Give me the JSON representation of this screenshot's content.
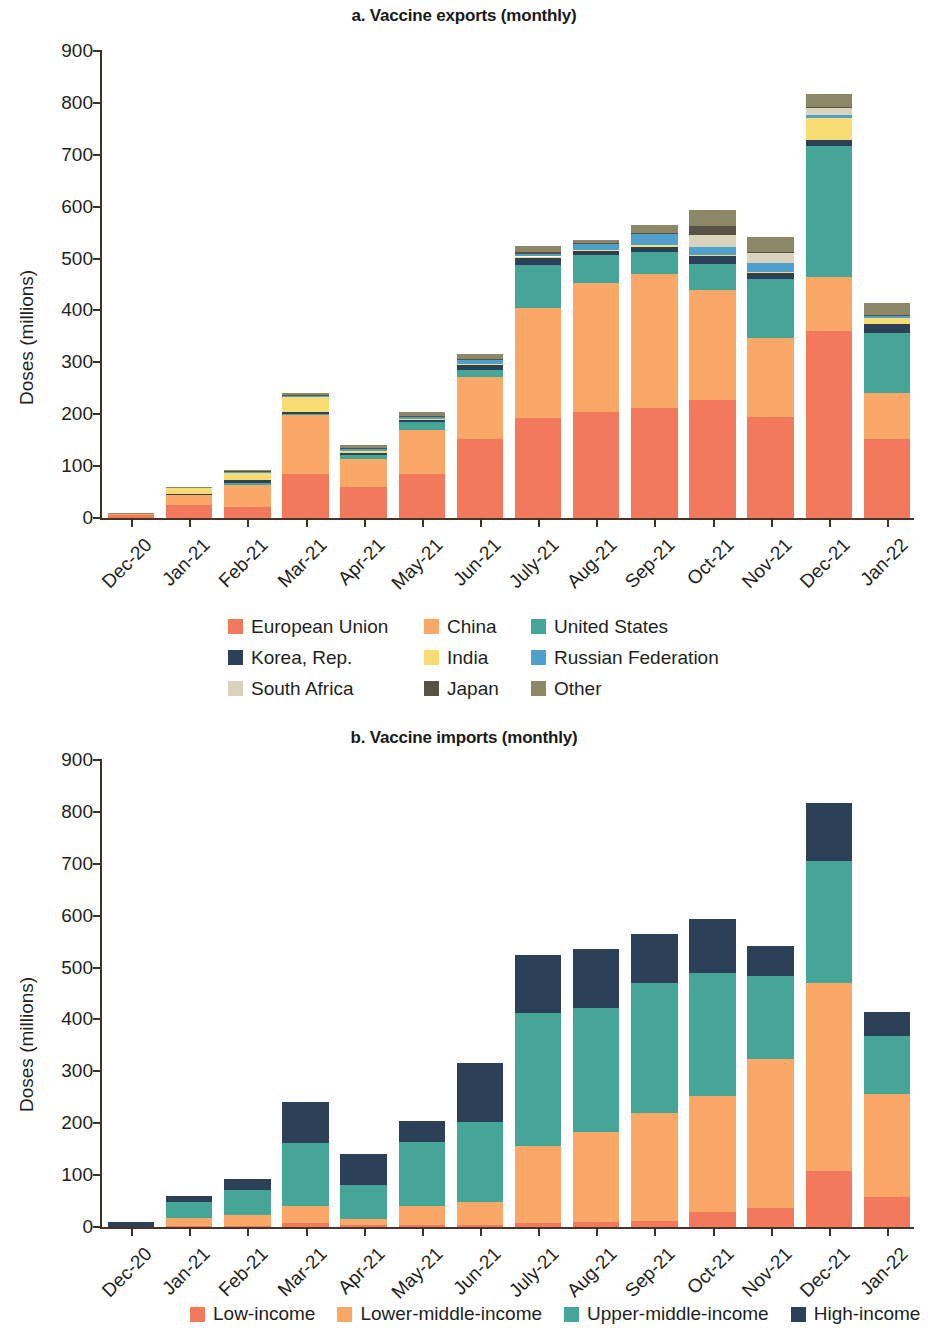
{
  "figure": {
    "panel_a_title": "a. Vaccine exports (monthly)",
    "panel_b_title": "b. Vaccine imports (monthly)",
    "y_axis_title": "Doses (millions)"
  },
  "colors": {
    "european_union": "#F2795B",
    "china": "#F9A868",
    "united_states": "#45A596",
    "korea_rep": "#2C4158",
    "india": "#F7DC74",
    "russian_federation": "#4FA0CC",
    "south_africa": "#D9D3BE",
    "japan": "#575242",
    "other": "#8C8767",
    "low_income": "#F2795B",
    "lower_middle_income": "#F9A868",
    "upper_middle_income": "#45A596",
    "high_income": "#2C4158",
    "axis": "#3A3226"
  },
  "chart_data": [
    {
      "type": "bar",
      "id": "vaccine-exports",
      "title": "a. Vaccine exports (monthly)",
      "stacked": true,
      "xlabel": "",
      "ylabel": "Doses (millions)",
      "ylim": [
        0,
        900
      ],
      "yticks": [
        0,
        100,
        200,
        300,
        400,
        500,
        600,
        700,
        800,
        900
      ],
      "grid": false,
      "legend_position": "bottom",
      "categories": [
        "Dec-20",
        "Jan-21",
        "Feb-21",
        "Mar-21",
        "Apr-21",
        "May-21",
        "Jun-21",
        "July-21",
        "Aug-21",
        "Sep-21",
        "Oct-21",
        "Nov-21",
        "Dec-21",
        "Jan-22"
      ],
      "series": [
        {
          "name": "European Union",
          "color": "#F2795B",
          "values": [
            6,
            26,
            22,
            85,
            60,
            85,
            153,
            192,
            205,
            212,
            228,
            194,
            361,
            152
          ]
        },
        {
          "name": "China",
          "color": "#F9A868",
          "values": [
            2,
            18,
            42,
            113,
            53,
            85,
            118,
            213,
            248,
            258,
            212,
            153,
            104,
            89
          ]
        },
        {
          "name": "United States",
          "color": "#45A596",
          "values": [
            0,
            0,
            4,
            2,
            8,
            16,
            14,
            82,
            53,
            42,
            49,
            114,
            252,
            116
          ]
        },
        {
          "name": "Korea, Rep.",
          "color": "#2C4158",
          "values": [
            0,
            2,
            5,
            5,
            4,
            3,
            10,
            14,
            9,
            11,
            15,
            12,
            11,
            17
          ]
        },
        {
          "name": "India",
          "color": "#F7DC74",
          "values": [
            0,
            12,
            14,
            28,
            5,
            2,
            2,
            3,
            2,
            3,
            2,
            2,
            42,
            12
          ]
        },
        {
          "name": "Russian Federation",
          "color": "#4FA0CC",
          "values": [
            0,
            0,
            2,
            3,
            3,
            5,
            8,
            5,
            11,
            22,
            17,
            17,
            7,
            3
          ]
        },
        {
          "name": "South Africa",
          "color": "#D9D3BE",
          "values": [
            0,
            0,
            0,
            0,
            0,
            0,
            0,
            0,
            0,
            0,
            23,
            18,
            13,
            0
          ]
        },
        {
          "name": "Japan",
          "color": "#575242",
          "values": [
            0,
            0,
            1,
            1,
            1,
            1,
            2,
            3,
            2,
            2,
            16,
            3,
            2,
            2
          ]
        },
        {
          "name": "Other",
          "color": "#8C8767",
          "values": [
            2,
            2,
            3,
            3,
            6,
            7,
            10,
            12,
            6,
            14,
            31,
            29,
            26,
            24
          ]
        }
      ],
      "totals": [
        10,
        60,
        93,
        240,
        140,
        204,
        317,
        524,
        536,
        564,
        593,
        542,
        818,
        415
      ]
    },
    {
      "type": "bar",
      "id": "vaccine-imports",
      "title": "b. Vaccine imports (monthly)",
      "stacked": true,
      "xlabel": "",
      "ylabel": "Doses (millions)",
      "ylim": [
        0,
        900
      ],
      "yticks": [
        0,
        100,
        200,
        300,
        400,
        500,
        600,
        700,
        800,
        900
      ],
      "grid": false,
      "legend_position": "bottom",
      "categories": [
        "Dec-20",
        "Jan-21",
        "Feb-21",
        "Mar-21",
        "Apr-21",
        "May-21",
        "Jun-21",
        "July-21",
        "Aug-21",
        "Sep-21",
        "Oct-21",
        "Nov-21",
        "Dec-21",
        "Jan-22"
      ],
      "series": [
        {
          "name": "Low-income",
          "color": "#F2795B",
          "values": [
            0,
            1,
            2,
            7,
            3,
            3,
            4,
            8,
            9,
            12,
            28,
            36,
            107,
            57
          ]
        },
        {
          "name": "Lower-middle-income",
          "color": "#F9A868",
          "values": [
            0,
            17,
            21,
            33,
            13,
            37,
            44,
            148,
            175,
            208,
            224,
            287,
            363,
            200
          ]
        },
        {
          "name": "Upper-middle-income",
          "color": "#45A596",
          "values": [
            0,
            30,
            48,
            122,
            65,
            123,
            154,
            256,
            239,
            251,
            237,
            160,
            235,
            112
          ]
        },
        {
          "name": "High-income",
          "color": "#2C4158",
          "values": [
            10,
            12,
            22,
            78,
            59,
            41,
            115,
            112,
            113,
            93,
            104,
            59,
            113,
            46
          ]
        }
      ],
      "totals": [
        10,
        60,
        93,
        240,
        140,
        204,
        317,
        524,
        536,
        564,
        593,
        542,
        818,
        415
      ]
    }
  ],
  "legend_a": [
    {
      "label": "European Union",
      "color": "#F2795B"
    },
    {
      "label": "China",
      "color": "#F9A868"
    },
    {
      "label": "United States",
      "color": "#45A596"
    },
    {
      "label": "Korea, Rep.",
      "color": "#2C4158"
    },
    {
      "label": "India",
      "color": "#F7DC74"
    },
    {
      "label": "Russian Federation",
      "color": "#4FA0CC"
    },
    {
      "label": "South Africa",
      "color": "#D9D3BE"
    },
    {
      "label": "Japan",
      "color": "#575242"
    },
    {
      "label": "Other",
      "color": "#8C8767"
    }
  ],
  "legend_b": [
    {
      "label": "Low-income",
      "color": "#F2795B"
    },
    {
      "label": "Lower-middle-income",
      "color": "#F9A868"
    },
    {
      "label": "Upper-middle-income",
      "color": "#45A596"
    },
    {
      "label": "High-income",
      "color": "#2C4158"
    }
  ]
}
